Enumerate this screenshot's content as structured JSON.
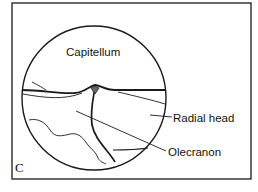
{
  "figure": {
    "panel_letter": "C",
    "labels": {
      "capitellum": "Capitellum",
      "radial_head": "Radial head",
      "olecranon": "Olecranon"
    },
    "colors": {
      "ink": "#1a1a1a",
      "background": "#ffffff"
    }
  }
}
